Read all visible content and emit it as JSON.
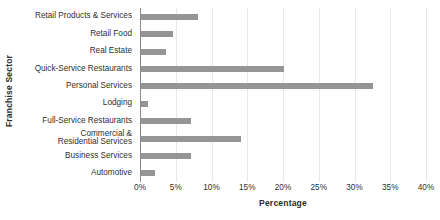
{
  "chart_data": {
    "type": "bar",
    "orientation": "horizontal",
    "title": "",
    "xlabel": "Percentage",
    "ylabel": "Franchise Sector",
    "xlim": [
      0,
      40
    ],
    "xtick_step": 5,
    "grid": true,
    "legend": false,
    "bar_color": "#959595",
    "axis_color": "#8a8a8a",
    "gridline_color": "#e9e9e9",
    "xticks": [
      "0%",
      "5%",
      "10%",
      "15%",
      "20%",
      "25%",
      "30%",
      "35%",
      "40%"
    ],
    "categories": [
      "Retail Products & Services",
      "Retail Food",
      "Real Estate",
      "Quick-Service Restaurants",
      "Personal Services",
      "Lodging",
      "Full-Service Restaurants",
      "Commercial &\nResidential Services",
      "Business Services",
      "Automotive"
    ],
    "values": [
      8,
      4.5,
      3.5,
      20,
      32.5,
      1,
      7,
      14,
      7,
      2
    ]
  }
}
